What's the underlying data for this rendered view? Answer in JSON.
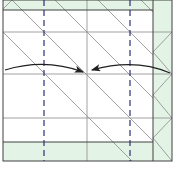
{
  "diagram": {
    "type": "origami-fold-step",
    "colors": {
      "paper": "#ffffff",
      "color_side": "#e3f3e6",
      "edge": "#404040",
      "crease": "#8a8a8a",
      "valley": "#2c2f7a",
      "arrow": "#202020"
    },
    "valley_folds": [
      {
        "x": 44,
        "label": "left valley fold"
      },
      {
        "x": 130,
        "label": "right valley fold"
      }
    ],
    "arrows": [
      {
        "name": "left-fold-arrow",
        "from": [
          5,
          69
        ],
        "to": [
          83,
          72
        ]
      },
      {
        "name": "right-fold-arrow",
        "from": [
          170,
          72
        ],
        "to": [
          92,
          70
        ]
      }
    ]
  }
}
